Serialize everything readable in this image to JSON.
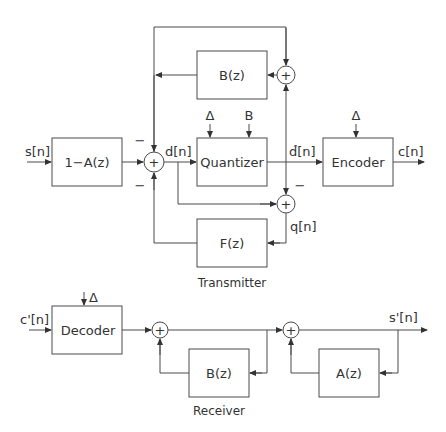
{
  "transmitter": {
    "caption": "Transmitter",
    "blocks": {
      "prefilter": "1−A(z)",
      "feedback_b": "B(z)",
      "quantizer": "Quantizer",
      "encoder": "Encoder",
      "noise_filter": "F(z)"
    },
    "signals": {
      "input": "s[n]",
      "difference": "d[n]",
      "quantized": "d̂[n]",
      "code": "c[n]",
      "quant_error": "q[n]"
    },
    "params": {
      "quantizer_step": "Δ",
      "quantizer_bits": "B",
      "encoder_step": "Δ"
    },
    "signs": {
      "sum_main_top": "−",
      "sum_main_bottom": "−",
      "sum_error_top": "−"
    }
  },
  "receiver": {
    "caption": "Receiver",
    "blocks": {
      "decoder": "Decoder",
      "feedback_b": "B(z)",
      "feedback_a": "A(z)"
    },
    "signals": {
      "input": "c'[n]",
      "output": "s'[n]"
    },
    "params": {
      "decoder_step": "Δ"
    }
  },
  "symbols": {
    "plus": "+"
  }
}
